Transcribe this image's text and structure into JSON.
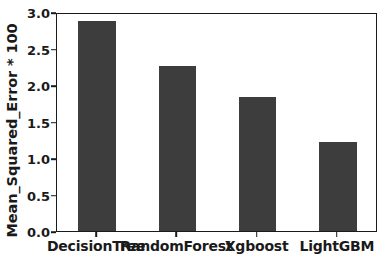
{
  "chart_data": {
    "type": "bar",
    "title": "",
    "xlabel": "",
    "ylabel": "Mean_Squared_Error * 100",
    "categories": [
      "DecisionTree",
      "RandomForest",
      "Xgboost",
      "LightGBM"
    ],
    "values": [
      2.88,
      2.26,
      1.84,
      1.22
    ],
    "ylim": [
      0.0,
      3.0
    ],
    "yticks": [
      "0.0",
      "0.5",
      "1.0",
      "1.5",
      "2.0",
      "2.5",
      "3.0"
    ],
    "ytick_values": [
      0.0,
      0.5,
      1.0,
      1.5,
      2.0,
      2.5,
      3.0
    ],
    "grid": false,
    "legend": false,
    "bar_color": "#3d3d3d",
    "axis_color": "#1a1a1a",
    "background": "#ffffff"
  }
}
